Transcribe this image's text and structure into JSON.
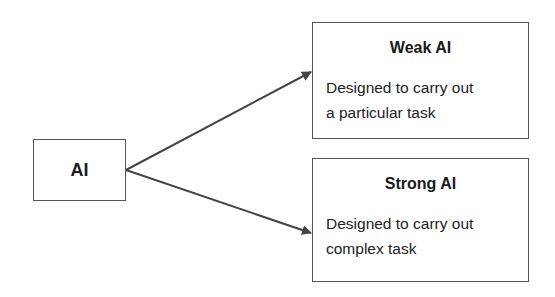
{
  "diagram": {
    "root": {
      "label": "AI"
    },
    "children": [
      {
        "title": "Weak AI",
        "description_lines": [
          "Designed to carry out",
          "a particular task"
        ]
      },
      {
        "title": "Strong AI",
        "description_lines": [
          "Designed to carry out",
          "complex task"
        ]
      }
    ],
    "edges": [
      {
        "from": "AI",
        "to": "Weak AI"
      },
      {
        "from": "AI",
        "to": "Strong AI"
      }
    ],
    "colors": {
      "stroke": "#555555",
      "text": "#1a1a1a",
      "background": "#ffffff"
    }
  }
}
